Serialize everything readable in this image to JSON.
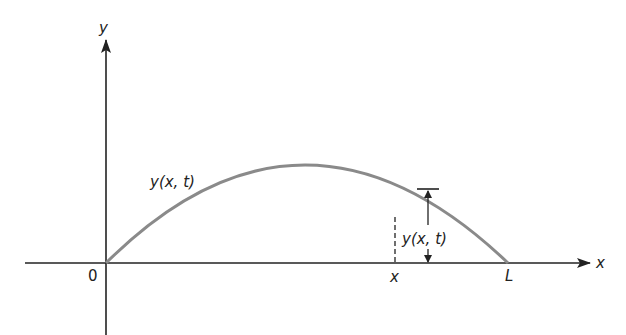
{
  "diagram": {
    "axes": {
      "y_label": "y",
      "x_label": "x",
      "origin_label": "0",
      "end_label": "L",
      "point_label": "x"
    },
    "curve_label": "y(x, t)",
    "displacement_label": "y(x, t)",
    "colors": {
      "axis": "#222222",
      "curve": "#8a8a8a",
      "text": "#222222"
    }
  }
}
